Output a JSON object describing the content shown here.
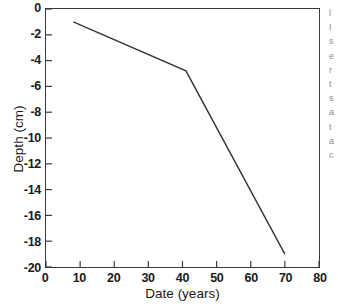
{
  "chart_data": {
    "type": "line",
    "title": "",
    "xlabel": "Date (years)",
    "ylabel": "Depth (cm)",
    "xlim": [
      0,
      80
    ],
    "ylim": [
      -20,
      0
    ],
    "xticks": [
      0,
      10,
      20,
      30,
      40,
      50,
      60,
      70,
      80
    ],
    "yticks": [
      0,
      -2,
      -4,
      -6,
      -8,
      -10,
      -12,
      -14,
      -16,
      -18,
      -20
    ],
    "xtick_labels": [
      "0",
      "10",
      "20",
      "30",
      "40",
      "50",
      "60",
      "70",
      "80"
    ],
    "ytick_labels": [
      "0",
      "-2",
      "-4",
      "-6",
      "-8",
      "-10",
      "-12",
      "-14",
      "-16",
      "-18",
      "-20"
    ],
    "grid": false,
    "legend": null,
    "tick_direction": "in",
    "frame": "box",
    "line_color": "#333333",
    "line_width": 1.4,
    "series": [
      {
        "name": "depth-profile",
        "x": [
          8,
          41,
          70
        ],
        "y": [
          -1.0,
          -4.8,
          -19.0
        ]
      }
    ]
  },
  "margin_fragments": [
    "l",
    "I",
    "s",
    "e",
    "r",
    "t",
    "s",
    "a",
    "t",
    "a",
    "c"
  ]
}
